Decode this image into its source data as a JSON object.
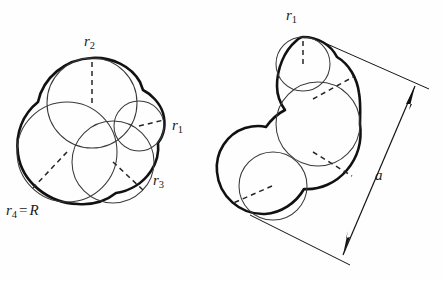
{
  "figure": {
    "background_color": "#fefefe",
    "stroke_color": "#111111",
    "inner_stroke_color": "#3a3a3a",
    "dash_color": "#262626",
    "left_panel": {
      "name": "four-circle-packing",
      "circle_count": 4,
      "labels": [
        {
          "id": "r2",
          "base": "r",
          "sub": "2",
          "text": "r2",
          "x": 84,
          "y": 46
        },
        {
          "id": "r1",
          "base": "r",
          "sub": "1",
          "text": "r1",
          "x": 172,
          "y": 130
        },
        {
          "id": "r3",
          "base": "r",
          "sub": "3",
          "text": "r3",
          "x": 153,
          "y": 185
        },
        {
          "id": "r4",
          "base": "r",
          "sub": "4",
          "suffix": "= R",
          "text": "r4 = R",
          "x": 6,
          "y": 215
        }
      ],
      "circles": [
        {
          "id": "c2",
          "label": "r2",
          "cx": 92,
          "cy": 103,
          "r": 45
        },
        {
          "id": "c4",
          "label": "r4 = R",
          "cx": 67,
          "cy": 152,
          "r": 50
        },
        {
          "id": "c3",
          "label": "r3",
          "cx": 113,
          "cy": 162,
          "r": 41
        },
        {
          "id": "c1",
          "label": "r1",
          "cx": 139,
          "cy": 126,
          "r": 25
        }
      ]
    },
    "right_panel": {
      "name": "three-circle-packing-with-dimension",
      "circle_count": 3,
      "labels": [
        {
          "id": "r1",
          "base": "r",
          "sub": "1",
          "text": "r1",
          "x": 286,
          "y": 20
        },
        {
          "id": "a",
          "base": "a",
          "sub": "",
          "text": "a",
          "x": 375,
          "y": 180
        }
      ],
      "circles": [
        {
          "id": "cTop",
          "label": "r1",
          "cx": 303,
          "cy": 64,
          "r": 27
        },
        {
          "id": "cMiddle",
          "label": "",
          "cx": 318,
          "cy": 124,
          "r": 42
        },
        {
          "id": "cBottom",
          "label": "",
          "cx": 273,
          "cy": 186,
          "r": 34
        }
      ],
      "dimension": {
        "label": "a",
        "arrow_both_ends": true
      }
    }
  }
}
